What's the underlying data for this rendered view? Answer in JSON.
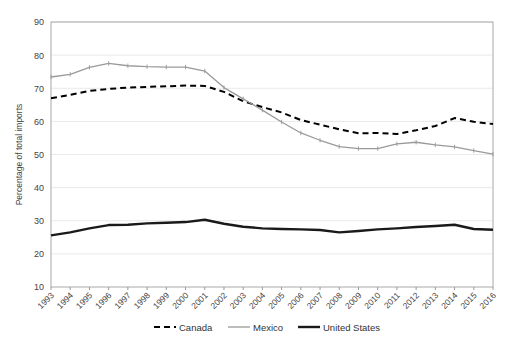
{
  "chart_data": {
    "type": "line",
    "title": "",
    "xlabel": "",
    "ylabel": "Percentage of total imports",
    "ylim": [
      10,
      90
    ],
    "ytick_step": 10,
    "yticks": [
      10,
      20,
      30,
      40,
      50,
      60,
      70,
      80,
      90
    ],
    "grid": true,
    "legend_position": "bottom",
    "categories": [
      "1993",
      "1994",
      "1995",
      "1996",
      "1997",
      "1998",
      "1999",
      "2000",
      "2001",
      "2002",
      "2003",
      "2004",
      "2005",
      "2006",
      "2007",
      "2008",
      "2009",
      "2010",
      "2011",
      "2012",
      "2013",
      "2014",
      "2015",
      "2016"
    ],
    "series": [
      {
        "name": "Canada",
        "style": "dashed-black",
        "color": "#000000",
        "values": [
          67.0,
          68.0,
          69.2,
          69.8,
          70.2,
          70.4,
          70.6,
          70.8,
          70.7,
          68.9,
          66.1,
          64.3,
          62.7,
          60.4,
          59.0,
          57.6,
          56.4,
          56.5,
          56.2,
          57.3,
          58.6,
          61.0,
          59.9,
          59.2
        ]
      },
      {
        "name": "Mexico",
        "style": "solid-gray",
        "color": "#9a9a9a",
        "values": [
          73.4,
          74.2,
          76.3,
          77.5,
          76.8,
          76.5,
          76.4,
          76.4,
          75.2,
          70.2,
          66.8,
          63.4,
          59.8,
          56.5,
          54.3,
          52.4,
          51.8,
          51.8,
          53.2,
          53.7,
          52.9,
          52.3,
          51.2,
          50.1
        ]
      },
      {
        "name": "United States",
        "style": "solid-black-thick",
        "color": "#1a1a1a",
        "values": [
          25.6,
          26.5,
          27.7,
          28.7,
          28.8,
          29.2,
          29.4,
          29.6,
          30.3,
          29.1,
          28.2,
          27.7,
          27.5,
          27.4,
          27.2,
          26.5,
          26.9,
          27.4,
          27.7,
          28.1,
          28.4,
          28.8,
          27.5,
          27.3
        ]
      }
    ]
  },
  "legend": {
    "items": [
      {
        "label": "Canada",
        "swatch": "dashed-black"
      },
      {
        "label": "Mexico",
        "swatch": "solid-gray"
      },
      {
        "label": "United States",
        "swatch": "solid-black-thick"
      }
    ]
  }
}
